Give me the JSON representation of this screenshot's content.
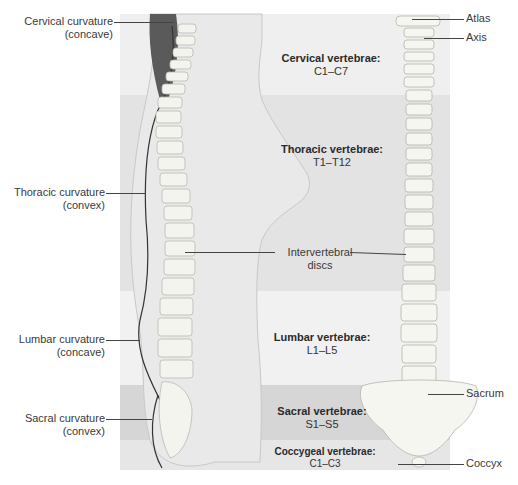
{
  "figure": {
    "left_labels": [
      {
        "line1": "Cervical curvature",
        "line2": "(concave)"
      },
      {
        "line1": "Thoracic curvature",
        "line2": "(convex)"
      },
      {
        "line1": "Lumbar curvature",
        "line2": "(concave)"
      },
      {
        "line1": "Sacral curvature",
        "line2": "(convex)"
      }
    ],
    "regions": [
      {
        "name": "Cervical vertebrae:",
        "range": "C1–C7",
        "color": "#efefef"
      },
      {
        "name": "Thoracic vertebrae:",
        "range": "T1–T12",
        "color": "#e3e3e3"
      },
      {
        "name": "Lumbar vertebrae:",
        "range": "L1–L5",
        "color": "#f1f1f1"
      },
      {
        "name": "Sacral vertebrae:",
        "range": "S1–S5",
        "color": "#d6d6d6"
      },
      {
        "name": "Coccygeal vertebrae:",
        "range": "C1–C3",
        "color": "#e6e6e6"
      }
    ],
    "center_label": {
      "line1": "Intervertebral",
      "line2": "discs"
    },
    "right_labels": [
      "Atlas",
      "Axis",
      "Sacrum",
      "Coccyx"
    ]
  }
}
